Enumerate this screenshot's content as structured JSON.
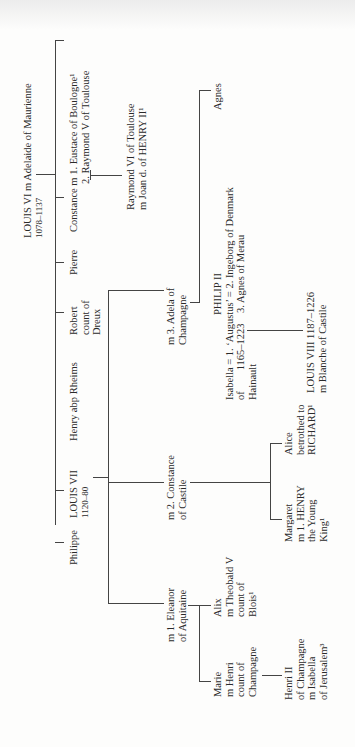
{
  "tree": {
    "root": {
      "lines": [
        "LOUIS VI m Adelaide of Maurienne",
        "1078–1137"
      ]
    },
    "children_of_louis_vi": [
      {
        "id": "philippe",
        "lines": [
          "Philippe"
        ]
      },
      {
        "id": "louis_vii",
        "lines": [
          "LOUIS VII",
          "1120–80"
        ]
      },
      {
        "id": "henry",
        "lines": [
          "Henry abp Rheims"
        ]
      },
      {
        "id": "robert",
        "lines": [
          "Robert",
          "count of",
          "Dreux"
        ]
      },
      {
        "id": "pierre",
        "lines": [
          "Pierre"
        ]
      },
      {
        "id": "constance",
        "lines": [
          "Constance m 1. Eustace of Boulogne¹",
          "2. Raymond V of Toulouse"
        ]
      }
    ],
    "raymond_vi": {
      "lines": [
        "Raymond VI of Toulouse",
        "m Joan d. of HENRY II¹"
      ]
    },
    "wives_of_louis_vii": [
      {
        "id": "eleanor",
        "lines": [
          "m 1. Eleanor",
          "of Aquitaine"
        ]
      },
      {
        "id": "constance_castile",
        "lines": [
          "m 2. Constance",
          "of Castile"
        ]
      },
      {
        "id": "adela",
        "lines": [
          "m 3. Adela of",
          "Champagne"
        ]
      }
    ],
    "children_of_eleanor": [
      {
        "id": "marie",
        "lines": [
          "Marie",
          "m Henri",
          "count of",
          "Champagne"
        ]
      },
      {
        "id": "alix",
        "lines": [
          "Alix",
          "m Theobald V",
          "count of",
          "Blois¹"
        ]
      }
    ],
    "henri_ii": {
      "lines": [
        "Henri II",
        "of Champagne",
        "m Isabella",
        "of Jerusalem³"
      ]
    },
    "children_of_constance_castile": [
      {
        "id": "margaret",
        "lines": [
          "Margaret",
          "m 1. HENRY",
          "the Young",
          "King¹"
        ]
      },
      {
        "id": "alice",
        "lines": [
          "Alice",
          "betrothed to",
          "RICHARD¹"
        ]
      }
    ],
    "philip_ii": {
      "lines": [
        "PHILIP II",
        "Isabella = 1. ‘Augustus’ = 2. Ingeborg of Denmark",
        "of        1165–1223    3. Agnes of Merau",
        "Hainault"
      ]
    },
    "agnes": {
      "lines": [
        "Agnes"
      ]
    },
    "louis_viii": {
      "lines": [
        "LOUIS VIII 1187–1226",
        "m Blanche of Castile"
      ]
    }
  }
}
